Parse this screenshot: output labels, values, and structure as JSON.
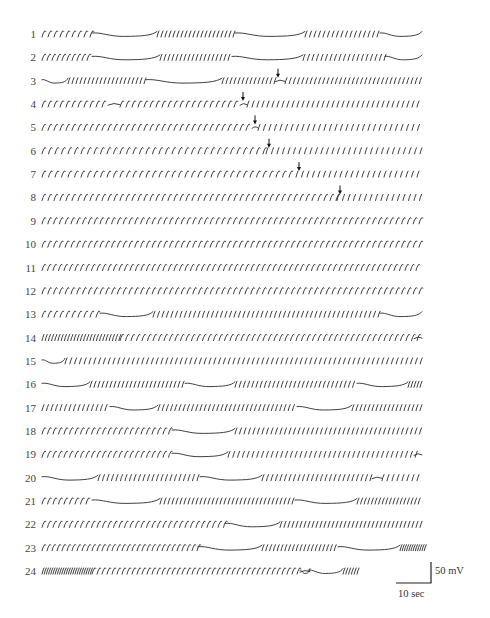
{
  "figure": {
    "type": "electrophysiology-trace-figure",
    "row_count": 24,
    "scale_bar": {
      "voltage_label": "50 mV",
      "time_label": "10 sec"
    },
    "arrow_marker": "down-arrow",
    "trace_color": "#2a2a2a"
  },
  "rows": [
    {
      "label": "1",
      "segments": [
        [
          "s",
          42,
          92,
          6,
          "slow"
        ],
        [
          "q",
          92,
          157
        ],
        [
          "s",
          157,
          235,
          4,
          "fast"
        ],
        [
          "q",
          235,
          305
        ],
        [
          "s",
          305,
          380,
          4.5,
          "fast"
        ],
        [
          "q",
          380,
          422
        ]
      ]
    },
    {
      "label": "2",
      "segments": [
        [
          "s",
          42,
          92,
          5,
          "slow"
        ],
        [
          "q",
          92,
          160
        ],
        [
          "s",
          160,
          232,
          4,
          "fast"
        ],
        [
          "q",
          232,
          303
        ],
        [
          "s",
          303,
          385,
          4.5,
          "fast"
        ],
        [
          "q",
          385,
          422
        ]
      ]
    },
    {
      "label": "3",
      "segments": [
        [
          "q",
          42,
          68
        ],
        [
          "s",
          68,
          146,
          4,
          "fast"
        ],
        [
          "q",
          146,
          222
        ],
        [
          "s",
          222,
          275,
          4,
          "fast"
        ],
        [
          "w",
          275,
          285
        ],
        [
          "s",
          285,
          422,
          4.2,
          "fast"
        ]
      ],
      "arrow_x": 278
    },
    {
      "label": "4",
      "segments": [
        [
          "s",
          42,
          108,
          6,
          "slow"
        ],
        [
          "w",
          108,
          120
        ],
        [
          "s",
          120,
          240,
          6,
          "slow"
        ],
        [
          "w",
          240,
          247
        ],
        [
          "s",
          247,
          422,
          5,
          "fast"
        ]
      ],
      "arrow_x": 243
    },
    {
      "label": "5",
      "segments": [
        [
          "s",
          42,
          252,
          6,
          "slow"
        ],
        [
          "w",
          252,
          258
        ],
        [
          "s",
          258,
          422,
          5.5,
          "fast"
        ]
      ],
      "arrow_x": 255
    },
    {
      "label": "6",
      "segments": [
        [
          "s",
          42,
          266,
          6.5,
          "slow"
        ],
        [
          "s",
          266,
          422,
          5.5,
          "fast"
        ]
      ],
      "arrow_x": 269
    },
    {
      "label": "7",
      "segments": [
        [
          "s",
          42,
          296,
          6.5,
          "slow"
        ],
        [
          "s",
          296,
          422,
          5.5,
          "fast"
        ]
      ],
      "arrow_x": 299
    },
    {
      "label": "8",
      "segments": [
        [
          "s",
          42,
          337,
          6,
          "slow"
        ],
        [
          "s",
          337,
          422,
          5.5,
          "fast"
        ]
      ],
      "arrow_x": 340
    },
    {
      "label": "9",
      "segments": [
        [
          "s",
          42,
          422,
          5.8,
          "slow"
        ]
      ]
    },
    {
      "label": "10",
      "segments": [
        [
          "s",
          42,
          422,
          5.8,
          "slow"
        ]
      ]
    },
    {
      "label": "11",
      "segments": [
        [
          "s",
          42,
          422,
          5.5,
          "slow"
        ]
      ]
    },
    {
      "label": "12",
      "segments": [
        [
          "s",
          42,
          422,
          5.8,
          "slow"
        ]
      ]
    },
    {
      "label": "13",
      "segments": [
        [
          "s",
          42,
          100,
          6,
          "slow"
        ],
        [
          "q",
          100,
          153
        ],
        [
          "s",
          153,
          380,
          4.5,
          "fast"
        ],
        [
          "q",
          380,
          422
        ]
      ]
    },
    {
      "label": "14",
      "segments": [
        [
          "s",
          42,
          120,
          3.2,
          "fast"
        ],
        [
          "s",
          120,
          420,
          5.5,
          "slow"
        ],
        [
          "w",
          414,
          422
        ]
      ]
    },
    {
      "label": "15",
      "segments": [
        [
          "q",
          42,
          65
        ],
        [
          "s",
          65,
          422,
          4.8,
          "fast"
        ]
      ]
    },
    {
      "label": "16",
      "segments": [
        [
          "q",
          42,
          90
        ],
        [
          "s",
          90,
          185,
          4,
          "fast"
        ],
        [
          "q",
          185,
          235
        ],
        [
          "s",
          235,
          357,
          4.2,
          "fast"
        ],
        [
          "q",
          357,
          408
        ],
        [
          "s",
          408,
          422,
          3,
          "fast"
        ]
      ]
    },
    {
      "label": "17",
      "segments": [
        [
          "s",
          42,
          110,
          4.5,
          "fast"
        ],
        [
          "q",
          110,
          158
        ],
        [
          "s",
          158,
          297,
          4.2,
          "fast"
        ],
        [
          "q",
          297,
          352
        ],
        [
          "s",
          352,
          422,
          4,
          "fast"
        ]
      ]
    },
    {
      "label": "18",
      "segments": [
        [
          "s",
          42,
          172,
          5.5,
          "slow"
        ],
        [
          "q",
          172,
          235
        ],
        [
          "s",
          235,
          422,
          4.5,
          "fast"
        ]
      ]
    },
    {
      "label": "19",
      "segments": [
        [
          "s",
          42,
          172,
          5.5,
          "slow"
        ],
        [
          "q",
          172,
          228
        ],
        [
          "s",
          228,
          420,
          4.8,
          "fast"
        ],
        [
          "w",
          414,
          422
        ]
      ]
    },
    {
      "label": "20",
      "segments": [
        [
          "q",
          42,
          98
        ],
        [
          "s",
          98,
          200,
          4.5,
          "fast"
        ],
        [
          "q",
          200,
          262
        ],
        [
          "s",
          262,
          372,
          4.5,
          "fast"
        ],
        [
          "w",
          372,
          382
        ],
        [
          "s",
          382,
          422,
          5,
          "fast"
        ]
      ]
    },
    {
      "label": "21",
      "segments": [
        [
          "s",
          42,
          92,
          5.5,
          "slow"
        ],
        [
          "q",
          92,
          160
        ],
        [
          "s",
          160,
          295,
          4,
          "fast"
        ],
        [
          "q",
          295,
          357
        ],
        [
          "s",
          357,
          422,
          3.6,
          "fast"
        ]
      ]
    },
    {
      "label": "22",
      "segments": [
        [
          "s",
          42,
          225,
          5.5,
          "slow"
        ],
        [
          "q",
          225,
          280
        ],
        [
          "s",
          280,
          422,
          4,
          "fast"
        ]
      ]
    },
    {
      "label": "23",
      "segments": [
        [
          "s",
          42,
          198,
          5,
          "slow"
        ],
        [
          "q",
          198,
          262
        ],
        [
          "s",
          262,
          338,
          3.8,
          "fast"
        ],
        [
          "q",
          338,
          400
        ],
        [
          "s",
          400,
          425,
          2.2,
          "fast"
        ]
      ]
    },
    {
      "label": "24",
      "segments": [
        [
          "s",
          42,
          92,
          2.2,
          "fast"
        ],
        [
          "s",
          92,
          300,
          5,
          "slow"
        ],
        [
          "q",
          300,
          310
        ],
        [
          "w",
          300,
          310
        ],
        [
          "q",
          308,
          343
        ],
        [
          "s",
          343,
          360,
          2.8,
          "fast"
        ]
      ]
    }
  ],
  "layout": {
    "first_row_y": 34,
    "row_spacing": 23.35,
    "spike_height": 5.5
  }
}
